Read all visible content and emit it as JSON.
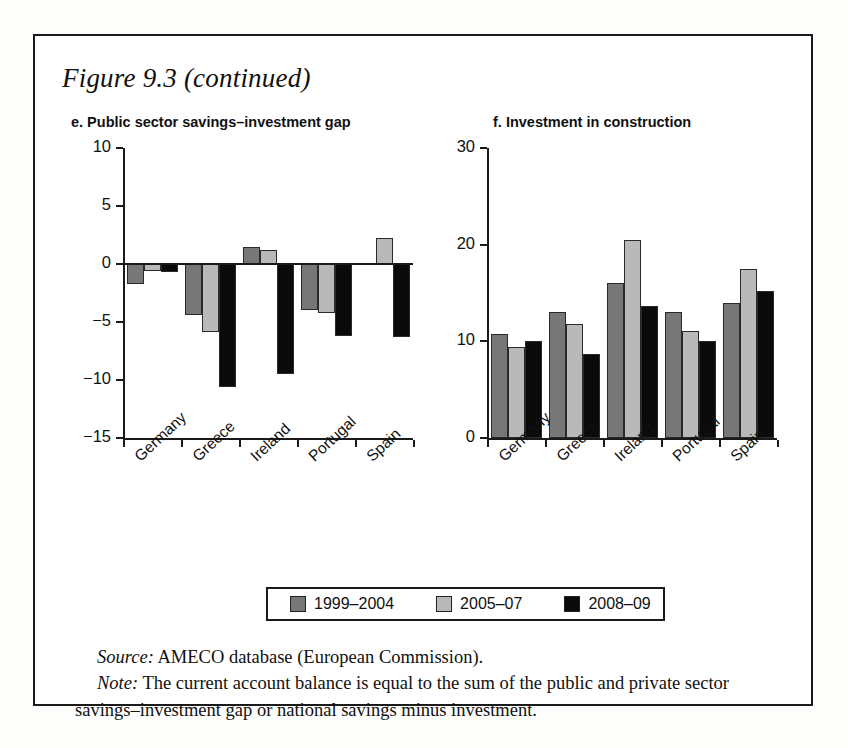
{
  "figure": {
    "title": "Figure 9.3 (continued)",
    "source_label": "Source:",
    "source_text": " AMECO database (European Commission).",
    "note_label": "Note:",
    "note_text": " The current account balance is equal to the sum of the public and private sector savings–investment gap or national savings minus investment."
  },
  "legend": {
    "items": [
      {
        "label": "1999–2004",
        "color": "#777777"
      },
      {
        "label": "2005–07",
        "color": "#b9b9b9"
      },
      {
        "label": "2008–09",
        "color": "#0a0a0a"
      }
    ]
  },
  "colors": {
    "series1": "#777777",
    "series2": "#b9b9b9",
    "series3": "#0a0a0a",
    "axis": "#1a1a1a",
    "frame": "#1a1a1a"
  },
  "chart_data": [
    {
      "type": "bar",
      "panel": "e",
      "title": "e. Public sector savings–investment gap",
      "categories": [
        "Germany",
        "Greece",
        "Ireland",
        "Portugal",
        "Spain"
      ],
      "series": [
        {
          "name": "1999–2004",
          "values": [
            -1.7,
            -4.4,
            1.5,
            -4.0,
            0.0
          ]
        },
        {
          "name": "2005–07",
          "values": [
            -0.6,
            -5.9,
            1.2,
            -4.2,
            2.2
          ]
        },
        {
          "name": "2008–09",
          "values": [
            -0.7,
            -10.6,
            -9.5,
            -6.2,
            -6.3
          ]
        }
      ],
      "yticks": [
        10,
        5,
        0,
        -5,
        -10,
        -15
      ],
      "ylim": [
        -15,
        10
      ],
      "xlabel": "",
      "ylabel": "",
      "grid": false,
      "legend_position": "bottom-center"
    },
    {
      "type": "bar",
      "panel": "f",
      "title": "f. Investment in construction",
      "categories": [
        "Germany",
        "Greece",
        "Ireland",
        "Portugal",
        "Spain"
      ],
      "series": [
        {
          "name": "1999–2004",
          "values": [
            10.8,
            13.0,
            16.0,
            13.0,
            14.0
          ]
        },
        {
          "name": "2005–07",
          "values": [
            9.4,
            11.8,
            20.5,
            11.1,
            17.5
          ]
        },
        {
          "name": "2008–09",
          "values": [
            10.0,
            8.7,
            13.7,
            10.0,
            15.2
          ]
        }
      ],
      "yticks": [
        30,
        20,
        10,
        0
      ],
      "ylim": [
        0,
        30
      ],
      "xlabel": "",
      "ylabel": "",
      "grid": false,
      "legend_position": "bottom-center"
    }
  ]
}
